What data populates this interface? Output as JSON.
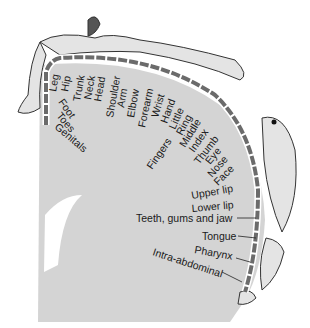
{
  "diagram": {
    "colors": {
      "cortex": "#d4d4d4",
      "segment": "#6b6b6b",
      "ink": "#1a1a1a",
      "figure": "#e2e2e2"
    },
    "labels": {
      "leg": "Leg",
      "hip": "Hip",
      "trunk": "Trunk",
      "neck": "Neck",
      "head": "Head",
      "shoulder": "Shoulder",
      "arm": "Arm",
      "elbow": "Elbow",
      "forearm": "Forearm",
      "wrist": "Wrist",
      "hand": "Hand",
      "little": "Little",
      "ring": "Ring",
      "middle": "Middle",
      "index": "Index",
      "thumb": "Thumb",
      "eye": "Eye",
      "nose": "Nose",
      "face": "Face",
      "fingers": "Fingers",
      "foot": "Foot",
      "toes": "Toes",
      "genitals": "Genitals",
      "upper_lip": "Upper lip",
      "lower_lip": "Lower lip",
      "teeth": "Teeth, gums and jaw",
      "tongue": "Tongue",
      "pharynx": "Pharynx",
      "intra_abdominal": "Intra-abdominal"
    }
  }
}
